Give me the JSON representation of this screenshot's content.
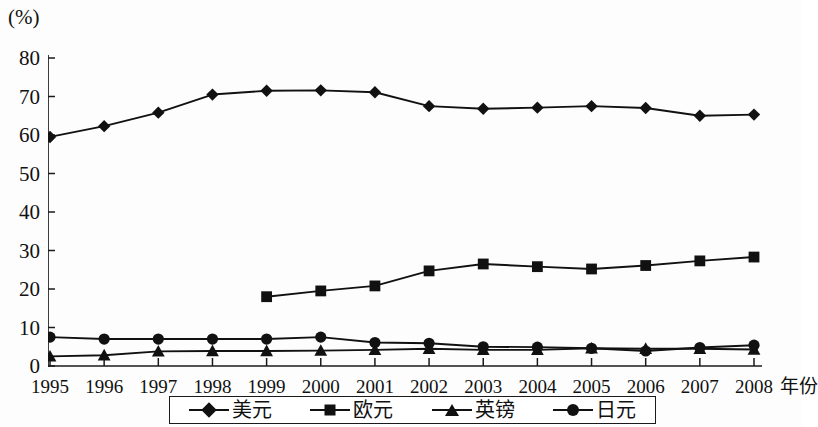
{
  "chart_data": {
    "type": "line",
    "title": "",
    "subtitle": "",
    "xlabel": "年份",
    "ylabel": "",
    "yunit": "(%)",
    "grid": false,
    "legend_position": "bottom",
    "xlim": [
      1995,
      2008
    ],
    "ylim": [
      0,
      80
    ],
    "ytick_step": 10,
    "categories": [
      "1995",
      "1996",
      "1997",
      "1998",
      "1999",
      "2000",
      "2001",
      "2002",
      "2003",
      "2004",
      "2005",
      "2006",
      "2007",
      "2008"
    ],
    "yticks": [
      "0",
      "10",
      "20",
      "30",
      "40",
      "50",
      "60",
      "70",
      "80"
    ],
    "series": [
      {
        "name": "美元",
        "marker": "diamond",
        "color": "#111111",
        "values": [
          59.5,
          62.3,
          65.8,
          70.5,
          71.5,
          71.6,
          71.1,
          67.5,
          66.8,
          67.1,
          67.5,
          67.0,
          65.0,
          65.3
        ]
      },
      {
        "name": "欧元",
        "marker": "square",
        "color": "#111111",
        "values": [
          null,
          null,
          null,
          null,
          18.0,
          19.5,
          20.8,
          24.7,
          26.5,
          25.8,
          25.2,
          26.1,
          27.3,
          28.3
        ]
      },
      {
        "name": "英镑",
        "marker": "triangle",
        "color": "#111111",
        "values": [
          2.5,
          2.8,
          3.8,
          3.9,
          3.9,
          4.0,
          4.2,
          4.5,
          4.2,
          4.2,
          4.6,
          4.5,
          4.5,
          4.3
        ]
      },
      {
        "name": "日元",
        "marker": "circle",
        "color": "#111111",
        "values": [
          7.5,
          7.0,
          7.0,
          7.0,
          7.0,
          7.5,
          6.1,
          5.9,
          5.0,
          4.9,
          4.6,
          3.9,
          4.8,
          5.4
        ]
      }
    ]
  },
  "axes": {
    "y_unit_label": "(%)",
    "x_axis_title": "年份"
  },
  "legend": {
    "items": [
      {
        "label": "美元",
        "marker": "diamond-marker"
      },
      {
        "label": "欧元",
        "marker": "square-marker"
      },
      {
        "label": "英镑",
        "marker": "triangle-marker"
      },
      {
        "label": "日元",
        "marker": "circle-marker"
      }
    ]
  }
}
